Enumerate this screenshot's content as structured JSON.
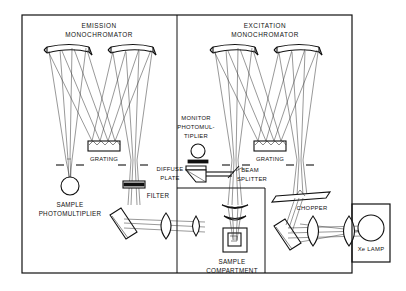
{
  "figure": {
    "background_color": "#ffffff",
    "line_color": "#111111"
  },
  "labels": {
    "emission_monochromator_line1": "EMISSION",
    "emission_monochromator_line2": "MONOCHROMATOR",
    "excitation_monochromator_line1": "EXCITATION",
    "excitation_monochromator_line2": "MONOCHROMATOR",
    "grating_left": "GRATING",
    "grating_right": "GRATING",
    "sample_photomultiplier_line1": "SAMPLE",
    "sample_photomultiplier_line2": "PHOTOMULTIPLIER",
    "filter": "FILTER",
    "monitor_photomultiplier_line1": "MONITOR",
    "monitor_photomultiplier_line2": "PHOTOMUL-",
    "monitor_photomultiplier_line3": "TIPLIER",
    "diffuse_plate_line1": "DIFFUSE",
    "diffuse_plate_line2": "PLATE",
    "beam_splitter_line1": "BEAM",
    "beam_splitter_line2": "SPLITTER",
    "sample_compartment_line1": "SAMPLE",
    "sample_compartment_line2": "COMPARTMENT",
    "chopper": "CHOPPER",
    "xe_lamp": "Xe LAMP"
  },
  "components": [
    {
      "name": "emission-monochromator",
      "type": "module"
    },
    {
      "name": "excitation-monochromator",
      "type": "module"
    },
    {
      "name": "sample-compartment",
      "type": "module"
    },
    {
      "name": "xe-lamp-housing",
      "type": "module"
    },
    {
      "name": "collimating-mirror",
      "type": "concave-mirror",
      "count": 4
    },
    {
      "name": "diffraction-grating",
      "type": "grating",
      "count": 2
    },
    {
      "name": "entrance-slit",
      "type": "slit",
      "count": 4
    },
    {
      "name": "photomultiplier-tube",
      "type": "detector",
      "count": 2
    },
    {
      "name": "optical-filter",
      "type": "filter",
      "count": 1
    },
    {
      "name": "diffuse-plate",
      "type": "scatterer",
      "count": 1
    },
    {
      "name": "beam-splitter",
      "type": "splitter",
      "count": 1
    },
    {
      "name": "folding-mirror",
      "type": "flat-mirror",
      "count": 2
    },
    {
      "name": "lens",
      "type": "lens",
      "count": 7
    },
    {
      "name": "chopper-wheel",
      "type": "chopper",
      "count": 1
    },
    {
      "name": "cuvette",
      "type": "sample-cell",
      "count": 1
    },
    {
      "name": "xenon-arc-lamp",
      "type": "source",
      "count": 1
    }
  ]
}
